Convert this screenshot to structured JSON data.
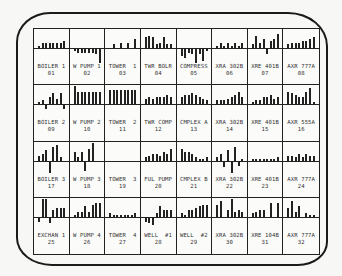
{
  "display": {
    "type": "multi-panel sparkbar monitor",
    "accent_color": "#222222",
    "background_color": "#f7f7f5"
  },
  "chart_data": {
    "type": "bar",
    "title": "",
    "layout": {
      "rows": 4,
      "cols": 8,
      "grid": true,
      "baseline": "zero line per panel"
    },
    "panels": [
      {
        "name": "BOILER 1",
        "id": "01",
        "values": [
          1,
          3,
          3,
          3,
          3,
          3,
          3,
          4
        ]
      },
      {
        "name": "W PUMP 1",
        "id": "02",
        "values": [
          -1,
          -2,
          -2,
          -2,
          -2,
          -2,
          -3,
          -8
        ]
      },
      {
        "name": "TOWER 1",
        "id": "03",
        "values": [
          0,
          2,
          0,
          3,
          0,
          3,
          0,
          5
        ]
      },
      {
        "name": "TWR BOLR",
        "id": "04",
        "values": [
          6,
          7,
          6,
          2,
          3,
          6,
          2,
          2
        ]
      },
      {
        "name": "COMPRESS",
        "id": "05",
        "values": [
          -4,
          -5,
          -2,
          -3,
          -8,
          -3,
          -7,
          -1
        ]
      },
      {
        "name": "XRA 302B",
        "id": "06",
        "values": [
          1,
          3,
          1,
          3,
          1,
          3,
          1,
          3
        ]
      },
      {
        "name": "XRE 401B",
        "id": "07",
        "values": [
          2,
          7,
          3,
          5,
          -3,
          4,
          5,
          8
        ]
      },
      {
        "name": "AXR 777A",
        "id": "08",
        "values": [
          2,
          3,
          3,
          3,
          4,
          4,
          5,
          6
        ]
      },
      {
        "name": "BOILER 2",
        "id": "09",
        "values": [
          1,
          2,
          -2,
          4,
          6,
          3,
          6,
          -2
        ]
      },
      {
        "name": "W PUMP 2",
        "id": "10",
        "values": [
          10,
          7,
          7,
          7,
          7,
          7,
          7,
          7
        ]
      },
      {
        "name": "TOWER 2",
        "id": "11",
        "values": [
          8,
          8,
          8,
          8,
          8,
          8,
          8,
          8
        ]
      },
      {
        "name": "TWR COMP",
        "id": "12",
        "values": [
          3,
          4,
          3,
          4,
          4,
          4,
          5,
          4
        ]
      },
      {
        "name": "CMPLEX A",
        "id": "13",
        "values": [
          4,
          5,
          5,
          6,
          5,
          4,
          3,
          2
        ]
      },
      {
        "name": "XRA 302B",
        "id": "14",
        "values": [
          2,
          2,
          2,
          3,
          4,
          5,
          7,
          4
        ]
      },
      {
        "name": "XRE 401B",
        "id": "15",
        "values": [
          1,
          2,
          2,
          4,
          4,
          5,
          3,
          4
        ]
      },
      {
        "name": "AXR 555A",
        "id": "16",
        "values": [
          7,
          6,
          5,
          4,
          4,
          7,
          9,
          1
        ]
      },
      {
        "name": "BOILER 3",
        "id": "17",
        "values": [
          3,
          4,
          6,
          -6,
          8,
          9,
          2,
          0
        ]
      },
      {
        "name": "W PUMP 3",
        "id": "18",
        "values": [
          5,
          2,
          5,
          -5,
          7,
          10,
          0,
          0
        ]
      },
      {
        "name": "TOWER 3",
        "id": "19",
        "values": [
          0,
          0,
          0,
          0,
          0,
          0,
          0,
          0
        ]
      },
      {
        "name": "FUL PUMP",
        "id": "20",
        "values": [
          2,
          3,
          4,
          4,
          3,
          5,
          4,
          7
        ]
      },
      {
        "name": "CMPLEX B",
        "id": "21",
        "values": [
          7,
          5,
          5,
          4,
          2,
          1,
          1,
          2
        ]
      },
      {
        "name": "XRA 302B",
        "id": "22",
        "values": [
          2,
          4,
          -3,
          6,
          -6,
          8,
          -2,
          1
        ]
      },
      {
        "name": "XRE 401B",
        "id": "23",
        "values": [
          1,
          1,
          1,
          1,
          1,
          1,
          1,
          2
        ]
      },
      {
        "name": "AXR 777A",
        "id": "24",
        "values": [
          3,
          3,
          2,
          4,
          2,
          4,
          3,
          3
        ]
      },
      {
        "name": "EXCHAN 1",
        "id": "25",
        "values": [
          -2,
          10,
          10,
          -3,
          4,
          5,
          5,
          5
        ]
      },
      {
        "name": "W PUMP 4",
        "id": "26",
        "values": [
          1,
          3,
          3,
          6,
          3,
          7,
          8,
          8
        ]
      },
      {
        "name": "TOWER 4",
        "id": "27",
        "values": [
          2,
          1,
          1,
          1,
          1,
          1,
          1,
          2
        ]
      },
      {
        "name": "WELL #1",
        "id": "28",
        "values": [
          -2,
          -3,
          -4,
          2,
          6,
          4,
          4,
          4
        ]
      },
      {
        "name": "WELL #2",
        "id": "29",
        "values": [
          2,
          1,
          4,
          4,
          5,
          6,
          7,
          7
        ]
      },
      {
        "name": "XRA 302B",
        "id": "30",
        "values": [
          7,
          9,
          0,
          4,
          10,
          3,
          4,
          3
        ]
      },
      {
        "name": "XRE 104B",
        "id": "31",
        "values": [
          2,
          3,
          4,
          4,
          0,
          8,
          0,
          8
        ]
      },
      {
        "name": "AXR 777A",
        "id": "32",
        "values": [
          5,
          9,
          3,
          6,
          0,
          2,
          1,
          1
        ]
      }
    ]
  },
  "cells": [
    {
      "label": "BOILER 1",
      "num": "01"
    },
    {
      "label": "W PUMP 1",
      "num": "02"
    },
    {
      "label": "TOWER  1",
      "num": "03"
    },
    {
      "label": "TWR BOLR",
      "num": "04"
    },
    {
      "label": "COMPRESS",
      "num": "05"
    },
    {
      "label": "XRA 302B",
      "num": "06"
    },
    {
      "label": "XRE 401B",
      "num": "07"
    },
    {
      "label": "AXR 777A",
      "num": "08"
    },
    {
      "label": "BOILER 2",
      "num": "09"
    },
    {
      "label": "W PUMP 2",
      "num": "10"
    },
    {
      "label": "TOWER  2",
      "num": "11"
    },
    {
      "label": "TWR COMP",
      "num": "12"
    },
    {
      "label": "CMPLEX A",
      "num": "13"
    },
    {
      "label": "XRA 302B",
      "num": "14"
    },
    {
      "label": "XRE 401B",
      "num": "15"
    },
    {
      "label": "AXR 555A",
      "num": "16"
    },
    {
      "label": "BOILER 3",
      "num": "17"
    },
    {
      "label": "W PUMP 3",
      "num": "18"
    },
    {
      "label": "TOWER  3",
      "num": "19"
    },
    {
      "label": "FUL PUMP",
      "num": "20"
    },
    {
      "label": "CMPLEX B",
      "num": "21"
    },
    {
      "label": "XRA 302B",
      "num": "22"
    },
    {
      "label": "XRE 401B",
      "num": "23"
    },
    {
      "label": "AXR 777A",
      "num": "24"
    },
    {
      "label": "EXCHAN 1",
      "num": "25"
    },
    {
      "label": "W PUMP 4",
      "num": "26"
    },
    {
      "label": "TOWER  4",
      "num": "27"
    },
    {
      "label": "WELL  #1",
      "num": "28"
    },
    {
      "label": "WELL  #2",
      "num": "29"
    },
    {
      "label": "XRA 302B",
      "num": "30"
    },
    {
      "label": "XRE 104B",
      "num": "31"
    },
    {
      "label": "AXR 777A",
      "num": "32"
    }
  ]
}
